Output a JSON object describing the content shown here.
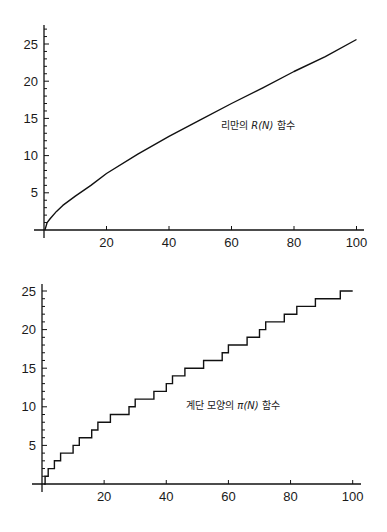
{
  "chart_data": [
    {
      "type": "line",
      "title": "",
      "annotation": "리만의 R(N) 함수",
      "annotation_parts": {
        "prefix": "리만의 ",
        "math": "R(N)",
        "suffix": " 함수"
      },
      "xlabel": "",
      "ylabel": "",
      "xlim": [
        0,
        100
      ],
      "ylim": [
        0,
        27
      ],
      "xticks": [
        20,
        40,
        60,
        80,
        100
      ],
      "yticks": [
        5,
        10,
        15,
        20,
        25
      ],
      "grid": false,
      "legend": "none",
      "series": [
        {
          "name": "R(N)",
          "x": [
            1,
            2,
            4,
            6,
            10,
            15,
            20,
            30,
            40,
            50,
            60,
            70,
            80,
            90,
            100
          ],
          "values": [
            1.0,
            1.54,
            2.5,
            3.3,
            4.56,
            6.0,
            7.6,
            10.2,
            12.6,
            14.8,
            17.0,
            19.1,
            21.3,
            23.3,
            25.6
          ]
        }
      ]
    },
    {
      "type": "line",
      "step": true,
      "title": "",
      "annotation": "계단 모양의 π(N) 함수",
      "annotation_parts": {
        "prefix": "계단 모양의 ",
        "math": "π(N)",
        "suffix": " 함수"
      },
      "xlabel": "",
      "ylabel": "",
      "xlim": [
        0,
        100
      ],
      "ylim": [
        0,
        25
      ],
      "xticks": [
        20,
        40,
        60,
        80,
        100
      ],
      "yticks": [
        5,
        10,
        15,
        20,
        25
      ],
      "grid": false,
      "legend": "none",
      "series": [
        {
          "name": "π(N)",
          "primes": [
            2,
            3,
            5,
            7,
            11,
            13,
            17,
            19,
            23,
            29,
            31,
            37,
            41,
            43,
            47,
            53,
            59,
            61,
            67,
            71,
            73,
            79,
            83,
            89,
            97
          ],
          "x_end": 100,
          "values_at_primes": [
            1,
            2,
            3,
            4,
            5,
            6,
            7,
            8,
            9,
            10,
            11,
            12,
            13,
            14,
            15,
            16,
            17,
            18,
            19,
            20,
            21,
            22,
            23,
            24,
            25
          ]
        }
      ]
    }
  ]
}
